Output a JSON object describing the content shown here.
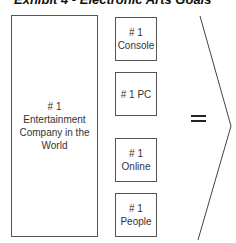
{
  "title": "Exhibit 4 - Electronic Arts Goals",
  "main_goal": "# 1 Entertainment Company in the World",
  "sub_goals": [
    {
      "rank": "# 1",
      "label": "Console"
    },
    {
      "rank": "# 1 PC",
      "label": ""
    },
    {
      "rank": "# 1",
      "label": "Online"
    },
    {
      "rank": "# 1",
      "label": "People"
    }
  ],
  "operator": "=",
  "colors": {
    "border": "#555555",
    "text": "#333333",
    "background": "#ffffff"
  }
}
